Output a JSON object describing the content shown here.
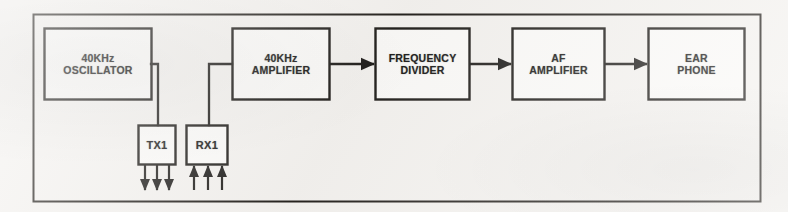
{
  "diagram": {
    "type": "block-diagram",
    "background_color": "#f4f2ef",
    "line_color": "#23211f",
    "frame": {
      "x": 33,
      "y": 14,
      "width": 728,
      "height": 188
    },
    "blocks": [
      {
        "id": "oscillator",
        "line1": "40KHz",
        "line2": "OSCILLATOR",
        "x": 44,
        "y": 28,
        "width": 108,
        "height": 72
      },
      {
        "id": "amplifier-40khz",
        "line1": "40KHz",
        "line2": "AMPLIFIER",
        "x": 232,
        "y": 28,
        "width": 98,
        "height": 72
      },
      {
        "id": "frequency-divider",
        "line1": "FREQUENCY",
        "line2": "DIVIDER",
        "x": 375,
        "y": 28,
        "width": 95,
        "height": 72
      },
      {
        "id": "af-amplifier",
        "line1": "AF",
        "line2": "AMPLIFIER",
        "x": 512,
        "y": 28,
        "width": 93,
        "height": 72
      },
      {
        "id": "ear-phone",
        "line1": "EAR",
        "line2": "PHONE",
        "x": 648,
        "y": 28,
        "width": 97,
        "height": 72
      }
    ],
    "transducers": [
      {
        "id": "tx1",
        "label": "TX1",
        "x": 138,
        "y": 125,
        "width": 38,
        "height": 40,
        "beam_direction": "down",
        "beam_count": 3
      },
      {
        "id": "rx1",
        "label": "RX1",
        "x": 186,
        "y": 125,
        "width": 42,
        "height": 40,
        "beam_direction": "up",
        "beam_count": 3
      }
    ],
    "connections": [
      {
        "id": "oscillator-to-tx1",
        "from": "oscillator",
        "to": "tx1",
        "style": "elbow",
        "arrow": false
      },
      {
        "id": "rx1-to-amplifier",
        "from": "rx1",
        "to": "amplifier-40khz",
        "style": "elbow",
        "arrow": false
      },
      {
        "id": "amplifier-to-divider",
        "from": "amplifier-40khz",
        "to": "frequency-divider",
        "style": "straight",
        "arrow": true
      },
      {
        "id": "divider-to-af-amplifier",
        "from": "frequency-divider",
        "to": "af-amplifier",
        "style": "straight",
        "arrow": true
      },
      {
        "id": "af-amplifier-to-ear-phone",
        "from": "af-amplifier",
        "to": "ear-phone",
        "style": "straight",
        "arrow": true
      }
    ]
  }
}
